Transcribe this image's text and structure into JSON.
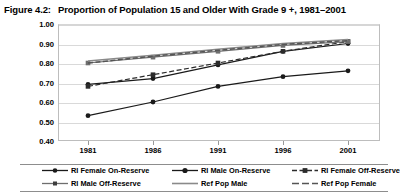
{
  "figure": {
    "label": "Figure 4.2:",
    "title": "Proportion of Population 15 and Older With Grade 9 +, 1981–2001"
  },
  "chart_data": {
    "type": "line",
    "title": "Proportion of Population 15 and Older With Grade 9 +, 1981–2001",
    "xlabel": "",
    "ylabel": "",
    "x": [
      "1981",
      "1986",
      "1991",
      "1996",
      "2001"
    ],
    "categories": [
      "1981",
      "1986",
      "1991",
      "1996",
      "2001"
    ],
    "ylim": [
      0.4,
      1.0
    ],
    "ytick_labels": [
      "1.00",
      "0.90",
      "0.80",
      "0.70",
      "0.60",
      "0.50",
      "0.40"
    ],
    "ytick_values": [
      1.0,
      0.9,
      0.8,
      0.7,
      0.6,
      0.5,
      0.4
    ],
    "grid": true,
    "legend_position": "bottom",
    "series": [
      {
        "name": "RI Female On-Reserve",
        "marker": "circle",
        "dash": "solid",
        "color": "#1a1a1a",
        "values": [
          0.53,
          0.6,
          0.68,
          0.73,
          0.76
        ]
      },
      {
        "name": "RI Male On-Reserve",
        "marker": "circle",
        "dash": "solid",
        "color": "#1a1a1a",
        "values": [
          0.69,
          0.72,
          0.79,
          0.86,
          0.9
        ]
      },
      {
        "name": "RI Female Off-Reserve",
        "marker": "square",
        "dash": "dashed",
        "color": "#2b2b2b",
        "values": [
          0.68,
          0.74,
          0.8,
          0.86,
          0.91
        ]
      },
      {
        "name": "RI Male Off-Reserve",
        "marker": "square",
        "dash": "solid",
        "color": "#6e6e6e",
        "values": [
          0.8,
          0.83,
          0.86,
          0.89,
          0.91
        ]
      },
      {
        "name": "Ref Pop Male",
        "marker": "none",
        "dash": "solid",
        "color": "#8a8a8a",
        "values": [
          0.81,
          0.84,
          0.87,
          0.9,
          0.92
        ]
      },
      {
        "name": "Ref Pop Female",
        "marker": "none",
        "dash": "dashed",
        "color": "#555555",
        "values": [
          0.8,
          0.835,
          0.865,
          0.895,
          0.915
        ]
      }
    ]
  },
  "legend": {
    "items": [
      {
        "label": "RI Female On-Reserve"
      },
      {
        "label": "RI Male On-Reserve"
      },
      {
        "label": "RI Female Off-Reserve"
      },
      {
        "label": "RI Male Off-Reserve"
      },
      {
        "label": "Ref Pop Male"
      },
      {
        "label": "Ref Pop Female"
      }
    ]
  }
}
